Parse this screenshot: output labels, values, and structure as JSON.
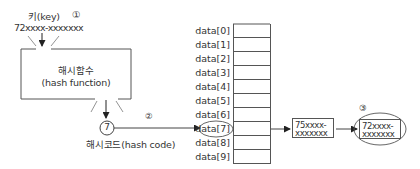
{
  "diagram": {
    "key": {
      "label": "키(key)",
      "step": "①",
      "value": "72xxxx-xxxxxxx"
    },
    "hash_function": {
      "label_ko": "해시함수",
      "label_en": "(hash function)"
    },
    "hash_code": {
      "value": "7",
      "label": "해시코드(hash code)",
      "step": "②"
    },
    "array": {
      "rows": [
        {
          "label": "data[0]"
        },
        {
          "label": "data[1]"
        },
        {
          "label": "data[2]"
        },
        {
          "label": "data[3]"
        },
        {
          "label": "data[4]"
        },
        {
          "label": "data[5]"
        },
        {
          "label": "data[6]"
        },
        {
          "label": "data[7]"
        },
        {
          "label": "data[8]"
        },
        {
          "label": "data[9]"
        }
      ],
      "highlighted_index": 7
    },
    "chain": [
      {
        "line1": "75xxxx-",
        "line2": "xxxxxxx"
      },
      {
        "line1": "72xxxx-",
        "line2": "xxxxxxx",
        "step": "③",
        "highlighted": true
      }
    ],
    "colors": {
      "line": "#444444",
      "text": "#333333"
    }
  }
}
